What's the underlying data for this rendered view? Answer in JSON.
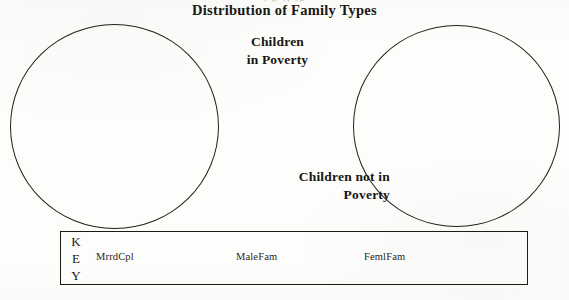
{
  "figure": {
    "title": "Distribution of Family Types",
    "cropped_line_above": "y                p                                                      y, yp",
    "labels": {
      "group_left": "Children\nin Poverty",
      "group_left_line_1": "Children",
      "group_left_line_2": "in Poverty",
      "group_right_line_1": "Children not in",
      "group_right_line_2": "Poverty"
    },
    "circles": [
      {
        "name": "children-in-poverty",
        "cx": 114,
        "cy": 126,
        "r": 104
      },
      {
        "name": "children-not-in-poverty",
        "cx": 457,
        "cy": 126,
        "r": 103
      }
    ],
    "key": {
      "heading_letters": [
        "K",
        "E",
        "Y"
      ],
      "heading_text": "KEY",
      "entries": [
        {
          "label": "MrrdCpl"
        },
        {
          "label": "MaleFam"
        },
        {
          "label": "FemlFam"
        }
      ]
    },
    "colors": {
      "ink": "#23201b",
      "page": "#fdfdfb",
      "key_border": "#1d1a16"
    }
  },
  "chart_data": {
    "type": "pie",
    "title": "Distribution of Family Types",
    "xlabel": "",
    "ylabel": "",
    "grid": false,
    "legend_position": "bottom",
    "annotations": [
      "Children in Poverty",
      "Children not in Poverty"
    ],
    "legend_entries": [
      "MrrdCpl",
      "MaleFam",
      "FemlFam"
    ],
    "note": "Two empty pie/circle outlines shown with no slices drawn and no values labeled.",
    "charts": [
      {
        "name": "Children in Poverty",
        "categories": [
          "MrrdCpl",
          "MaleFam",
          "FemlFam"
        ],
        "values": [
          null,
          null,
          null
        ]
      },
      {
        "name": "Children not in Poverty",
        "categories": [
          "MrrdCpl",
          "MaleFam",
          "FemlFam"
        ],
        "values": [
          null,
          null,
          null
        ]
      }
    ]
  }
}
